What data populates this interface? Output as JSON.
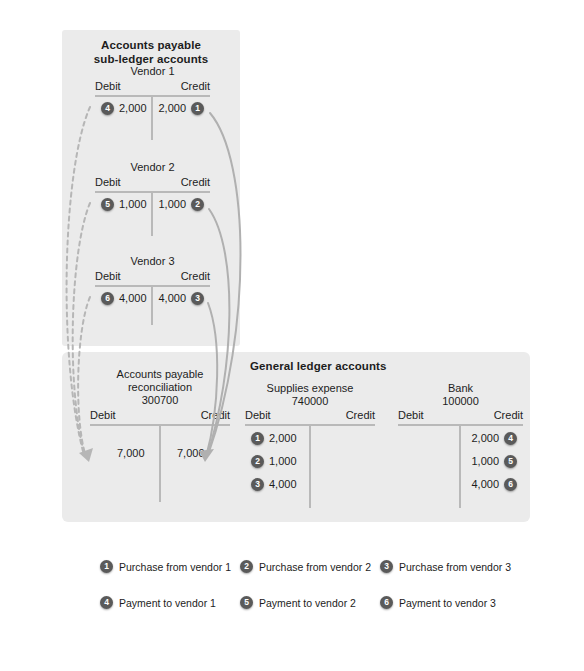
{
  "panels": {
    "subledger_title_line1": "Accounts payable",
    "subledger_title_line2": "sub-ledger accounts",
    "ledger_title": "General ledger accounts"
  },
  "labels": {
    "debit": "Debit",
    "credit": "Credit"
  },
  "accounts": {
    "vendor1": {
      "name": "Vendor 1",
      "debit_amount": "2,000",
      "debit_badge": "4",
      "credit_amount": "2,000",
      "credit_badge": "1"
    },
    "vendor2": {
      "name": "Vendor 2",
      "debit_amount": "1,000",
      "debit_badge": "5",
      "credit_amount": "1,000",
      "credit_badge": "2"
    },
    "vendor3": {
      "name": "Vendor 3",
      "debit_amount": "4,000",
      "debit_badge": "6",
      "credit_amount": "4,000",
      "credit_badge": "3"
    },
    "ap_reconciliation": {
      "name_line1": "Accounts payable",
      "name_line2": "reconciliation",
      "number": "300700",
      "debit_amount": "7,000",
      "credit_amount": "7,000"
    },
    "supplies_expense": {
      "name": "Supplies expense",
      "number": "740000",
      "rows": [
        {
          "badge": "1",
          "amount": "2,000"
        },
        {
          "badge": "2",
          "amount": "1,000"
        },
        {
          "badge": "3",
          "amount": "4,000"
        }
      ]
    },
    "bank": {
      "name": "Bank",
      "number": "100000",
      "rows": [
        {
          "amount": "2,000",
          "badge": "4"
        },
        {
          "amount": "1,000",
          "badge": "5"
        },
        {
          "amount": "4,000",
          "badge": "6"
        }
      ]
    }
  },
  "legend": [
    {
      "badge": "1",
      "text": "Purchase from vendor 1"
    },
    {
      "badge": "2",
      "text": "Purchase from vendor 2"
    },
    {
      "badge": "3",
      "text": "Purchase from vendor 3"
    },
    {
      "badge": "4",
      "text": "Payment to vendor 1"
    },
    {
      "badge": "5",
      "text": "Payment to vendor 2"
    },
    {
      "badge": "6",
      "text": "Payment to vendor 3"
    }
  ],
  "colors": {
    "panel_background": "#ebebeb",
    "badge_fill": "#5a5a5a",
    "rule": "#b9b9b9",
    "arrow_solid": "#b0b0b0",
    "arrow_dashed": "#b6b6b6",
    "text": "#1d1d1d"
  }
}
